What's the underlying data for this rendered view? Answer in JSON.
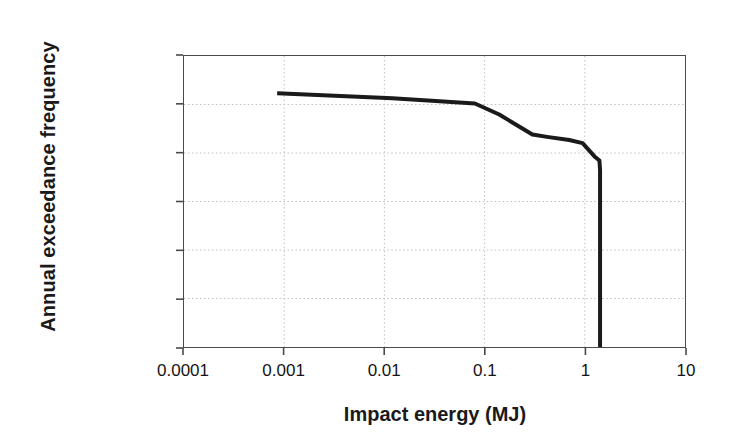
{
  "chart_data": {
    "type": "line",
    "title": "",
    "subtitle": "",
    "xlabel": "Impact energy (MJ)",
    "ylabel": "Annual exceedance frequency",
    "xscale": "log",
    "yscale": "log",
    "xlim": [
      0.0001,
      10
    ],
    "ylim": [
      1e-06,
      1
    ],
    "xticks": [
      0.0001,
      0.001,
      0.01,
      0.1,
      1,
      10
    ],
    "xticklabels": [
      "0.0001",
      "0.001",
      "0.01",
      "0.1",
      "1",
      "10"
    ],
    "yticks": [
      1e-06,
      1e-05,
      0.0001,
      0.001,
      0.01,
      0.1,
      1
    ],
    "yticklabels": [
      "0.000001",
      "0.00001",
      "0.0001",
      "0.001",
      "0.01",
      "0.1",
      "1"
    ],
    "grid": true,
    "grid_style": "dotted",
    "grid_color": "#bfbfbf",
    "legend": false,
    "legend_position": "none",
    "line_color": "#1a1a1a",
    "line_width": 4,
    "axis_color": "#4a4a4a",
    "series": [
      {
        "name": "Annual exceedance frequency",
        "x": [
          0.00085,
          0.012,
          0.08,
          0.14,
          0.3,
          0.42,
          0.7,
          0.95,
          1.25,
          1.4,
          1.42,
          1.42
        ],
        "y": [
          0.17,
          0.135,
          0.105,
          0.062,
          0.024,
          0.0215,
          0.0185,
          0.016,
          0.0085,
          0.007,
          0.0045,
          1e-06
        ]
      }
    ],
    "annotations": []
  },
  "axes": {
    "y_tick_labels": [
      {
        "value": "1",
        "frac": 0.0
      },
      {
        "value": "0.1",
        "frac": 0.16667
      },
      {
        "value": "0.01",
        "frac": 0.33333
      },
      {
        "value": "0.001",
        "frac": 0.5
      },
      {
        "value": "0.0001",
        "frac": 0.66667
      },
      {
        "value": "0.00001",
        "frac": 0.83333
      },
      {
        "value": "0.000001",
        "frac": 1.0
      }
    ],
    "x_tick_labels": [
      {
        "value": "0.0001",
        "frac": 0.0
      },
      {
        "value": "0.001",
        "frac": 0.2
      },
      {
        "value": "0.01",
        "frac": 0.4
      },
      {
        "value": "0.1",
        "frac": 0.6
      },
      {
        "value": "1",
        "frac": 0.8
      },
      {
        "value": "10",
        "frac": 1.0
      }
    ]
  }
}
